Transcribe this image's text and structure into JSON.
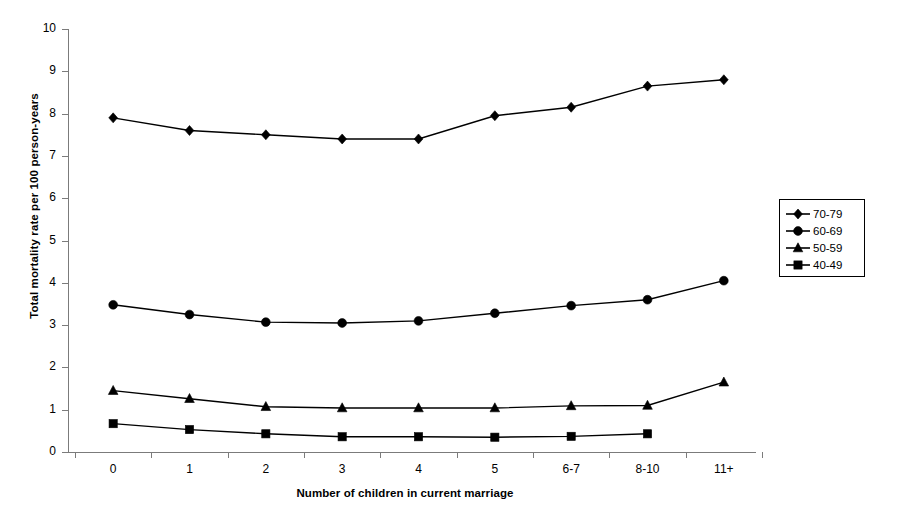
{
  "chart_data": {
    "type": "line",
    "title": "",
    "xlabel": "Number of children in current marriage",
    "ylabel": "Total mortality rate per 100 person-years",
    "categories": [
      "0",
      "1",
      "2",
      "3",
      "4",
      "5",
      "6-7",
      "8-10",
      "11+"
    ],
    "ylim": [
      0,
      10
    ],
    "y_ticks": [
      "0",
      "1",
      "2",
      "3",
      "4",
      "5",
      "6",
      "7",
      "8",
      "9",
      "10"
    ],
    "grid": false,
    "legend_position": "right",
    "series": [
      {
        "name": "70-79",
        "marker": "diamond",
        "values": [
          7.9,
          7.6,
          7.5,
          7.4,
          7.4,
          7.95,
          8.15,
          8.65,
          8.8
        ]
      },
      {
        "name": "60-69",
        "marker": "circle",
        "values": [
          3.48,
          3.25,
          3.07,
          3.05,
          3.1,
          3.28,
          3.46,
          3.6,
          4.05
        ]
      },
      {
        "name": "50-59",
        "marker": "triangle",
        "values": [
          1.45,
          1.26,
          1.07,
          1.04,
          1.04,
          1.04,
          1.09,
          1.1,
          1.65
        ]
      },
      {
        "name": "40-49",
        "marker": "square",
        "values": [
          0.67,
          0.53,
          0.43,
          0.36,
          0.36,
          0.35,
          0.37,
          0.43,
          null
        ]
      }
    ]
  },
  "legend": {
    "entries": [
      {
        "label": "70-79"
      },
      {
        "label": "60-69"
      },
      {
        "label": "50-59"
      },
      {
        "label": "40-49"
      }
    ]
  },
  "colors": {
    "series": "#000000",
    "axis": "#7b7b7b",
    "background": "#ffffff"
  }
}
